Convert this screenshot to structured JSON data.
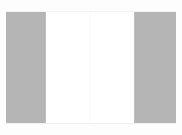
{
  "viewer": {
    "background_color": "#fdfdfd",
    "page_color": "#ffffff",
    "pane_color": "#b5b5b5",
    "gutter_color": "#fbfbfb",
    "state_label": "",
    "page_content_text": "",
    "left_pane_label": "",
    "right_pane_label": "",
    "gutter_label": "",
    "top_margin_label": "",
    "bottom_margin_label": "",
    "scrollbar_label": ""
  }
}
